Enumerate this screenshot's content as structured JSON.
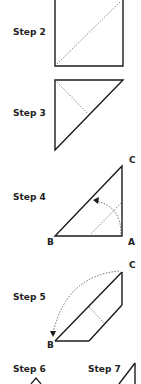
{
  "colors": {
    "line": "#1a1a1a",
    "dotted": "#555555",
    "text": "#222222",
    "background": "#ffffff"
  },
  "steps": [
    {
      "id": "step-2",
      "label": "Step 2"
    },
    {
      "id": "step-3",
      "label": "Step 3"
    },
    {
      "id": "step-4",
      "label": "Step 4",
      "points": {
        "a": "A",
        "b": "B",
        "c": "C"
      }
    },
    {
      "id": "step-5",
      "label": "Step 5",
      "points": {
        "b": "B",
        "c": "C"
      }
    },
    {
      "id": "step-6",
      "label": "Step 6"
    },
    {
      "id": "step-7",
      "label": "Step 7"
    }
  ]
}
